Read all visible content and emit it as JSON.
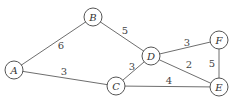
{
  "diagram": {
    "type": "weighted-undirected-graph",
    "nodes": [
      {
        "id": "A",
        "label": "A",
        "x": 14,
        "y": 70
      },
      {
        "id": "B",
        "label": "B",
        "x": 93,
        "y": 17
      },
      {
        "id": "C",
        "label": "C",
        "x": 116,
        "y": 86
      },
      {
        "id": "D",
        "label": "D",
        "x": 151,
        "y": 56
      },
      {
        "id": "F",
        "label": "F",
        "x": 219,
        "y": 40
      },
      {
        "id": "E",
        "label": "E",
        "x": 219,
        "y": 87
      }
    ],
    "edges": [
      {
        "from": "A",
        "to": "B",
        "weight": "6",
        "lx": 61,
        "ly": 45
      },
      {
        "from": "A",
        "to": "C",
        "weight": "3",
        "lx": 64,
        "ly": 71
      },
      {
        "from": "B",
        "to": "D",
        "weight": "5",
        "lx": 125,
        "ly": 30
      },
      {
        "from": "C",
        "to": "D",
        "weight": "3",
        "lx": 132,
        "ly": 66
      },
      {
        "from": "C",
        "to": "E",
        "weight": "4",
        "lx": 169,
        "ly": 80
      },
      {
        "from": "D",
        "to": "F",
        "weight": "3",
        "lx": 187,
        "ly": 42
      },
      {
        "from": "D",
        "to": "E",
        "weight": "2",
        "lx": 189,
        "ly": 64
      },
      {
        "from": "F",
        "to": "E",
        "weight": "5",
        "lx": 212,
        "ly": 63
      }
    ],
    "node_radius": 9,
    "colors": {
      "edge": "#6e6e6e",
      "node_stroke": "#555555",
      "text": "#333333"
    }
  }
}
